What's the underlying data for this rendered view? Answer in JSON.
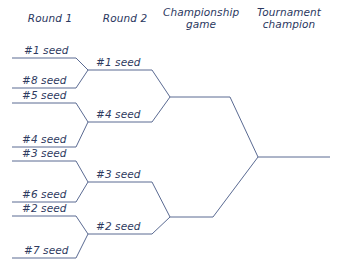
{
  "diagram": {
    "line_color": "#5a6a92",
    "text_color": "#2e3a60",
    "background": "#ffffff"
  },
  "headers": [
    {
      "id": "round-1",
      "label": "Round 1"
    },
    {
      "id": "round-2",
      "label": "Round 2"
    },
    {
      "id": "championship-game",
      "label": "Championship\ngame",
      "line1": "Championship",
      "line2": "game"
    },
    {
      "id": "tournament-champion",
      "label": "Tournament\nchampion",
      "line1": "Tournament",
      "line2": "champion"
    }
  ],
  "rounds": {
    "round1": {
      "name": "Round 1",
      "matchups": [
        {
          "top": "#1 seed",
          "bottom": "#8 seed",
          "winner": "#1 seed"
        },
        {
          "top": "#5 seed",
          "bottom": "#4 seed",
          "winner": "#4 seed"
        },
        {
          "top": "#3 seed",
          "bottom": "#6 seed",
          "winner": "#3 seed"
        },
        {
          "top": "#2 seed",
          "bottom": "#7 seed",
          "winner": "#2 seed"
        }
      ],
      "entries": [
        {
          "seed": "#1 seed"
        },
        {
          "seed": "#8 seed"
        },
        {
          "seed": "#5 seed"
        },
        {
          "seed": "#4 seed"
        },
        {
          "seed": "#3 seed"
        },
        {
          "seed": "#6 seed"
        },
        {
          "seed": "#2 seed"
        },
        {
          "seed": "#7 seed"
        }
      ]
    },
    "round2": {
      "name": "Round 2",
      "entries": [
        {
          "seed": "#1 seed"
        },
        {
          "seed": "#4 seed"
        },
        {
          "seed": "#3 seed"
        },
        {
          "seed": "#2 seed"
        }
      ]
    },
    "championship": {
      "name": "Championship game",
      "entries": []
    },
    "champion": {
      "name": "Tournament champion",
      "entries": []
    }
  }
}
